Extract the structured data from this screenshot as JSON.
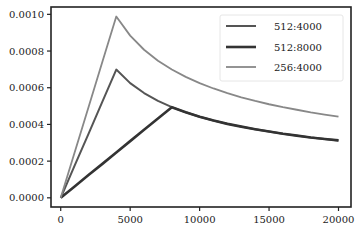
{
  "chart_data": {
    "type": "line",
    "title": "",
    "xlabel": "",
    "ylabel": "",
    "xlim": [
      -700,
      20900
    ],
    "ylim": [
      -5e-05,
      0.00104
    ],
    "grid": false,
    "legend_position": "top-right",
    "x_ticks": [
      0,
      5000,
      10000,
      15000,
      20000
    ],
    "x_tick_labels": [
      "0",
      "5000",
      "10000",
      "15000",
      "20000"
    ],
    "y_ticks": [
      0,
      0.0002,
      0.0004,
      0.0006,
      0.0008,
      0.001
    ],
    "y_tick_labels": [
      "0.0000",
      "0.0002",
      "0.0004",
      "0.0006",
      "0.0008",
      "0.0010"
    ],
    "series": [
      {
        "name": "512:4000",
        "color": "#555555",
        "x": [
          1,
          1000,
          2000,
          3000,
          4000,
          5000,
          6000,
          7000,
          8000,
          9000,
          10000,
          11000,
          12000,
          13000,
          14000,
          15000,
          16000,
          17000,
          18000,
          19000,
          20000
        ],
        "values": [
          1.7e-07,
          0.000175,
          0.000349,
          0.000524,
          0.000699,
          0.000625,
          0.000571,
          0.000528,
          0.000494,
          0.000466,
          0.000442,
          0.000421,
          0.000403,
          0.000388,
          0.000374,
          0.000361,
          0.000349,
          0.000339,
          0.000329,
          0.000321,
          0.000313
        ]
      },
      {
        "name": "512:8000",
        "color": "#333333",
        "x": [
          1,
          1000,
          2000,
          3000,
          4000,
          5000,
          6000,
          7000,
          8000,
          9000,
          10000,
          11000,
          12000,
          13000,
          14000,
          15000,
          16000,
          17000,
          18000,
          19000,
          20000
        ],
        "values": [
          6e-08,
          6.18e-05,
          0.000124,
          0.000185,
          0.000247,
          0.000309,
          0.000371,
          0.000432,
          0.000494,
          0.000466,
          0.000442,
          0.000421,
          0.000403,
          0.000388,
          0.000374,
          0.000361,
          0.000349,
          0.000339,
          0.000329,
          0.000321,
          0.000313
        ]
      },
      {
        "name": "256:4000",
        "color": "#888888",
        "x": [
          1,
          1000,
          2000,
          3000,
          4000,
          5000,
          6000,
          7000,
          8000,
          9000,
          10000,
          11000,
          12000,
          13000,
          14000,
          15000,
          16000,
          17000,
          18000,
          19000,
          20000
        ],
        "values": [
          2.5e-07,
          0.000247,
          0.000494,
          0.000741,
          0.000988,
          0.000884,
          0.000807,
          0.000747,
          0.000699,
          0.000659,
          0.000625,
          0.000596,
          0.000571,
          0.000548,
          0.000528,
          0.00051,
          0.000494,
          0.00048,
          0.000466,
          0.000454,
          0.000442
        ]
      }
    ]
  }
}
